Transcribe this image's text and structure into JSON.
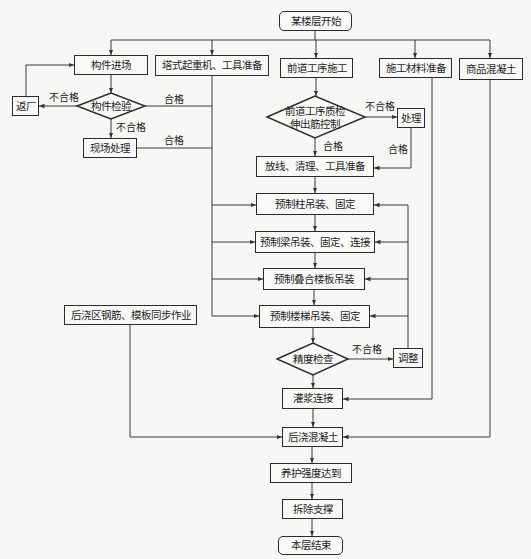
{
  "nodes": {
    "start": "某楼层开始",
    "component_arrival": "构件进场",
    "tower_crane_prep": "塔式起重机、工具准备",
    "prev_process": "前道工序施工",
    "material_prep": "施工材料准备",
    "ready_mix_concrete": "商品混凝土",
    "return_factory": "返厂",
    "component_inspection": "构件检验",
    "onsite_treatment": "现场处理",
    "prev_quality_check": {
      "line1": "前道工序质检",
      "line2": "伸出筋控制"
    },
    "treatment": "处理",
    "layout_clean_prep": "放线、清理、工具准备",
    "column_hoist": "预制柱吊装、固定",
    "beam_hoist": "预制梁吊装、固定、连接",
    "slab_hoist": "预制叠合楼板吊装",
    "stair_hoist": "预制楼梯吊装、固定",
    "precision_check": "精度检查",
    "adjust": "调整",
    "grouting": "灌浆连接",
    "post_pour_rebar_formwork": "后浇区钢筋、模板同步作业",
    "post_pour_concrete": "后浇混凝土",
    "curing": "养护强度达到",
    "remove_support": "拆除支撑",
    "end": "本层结束"
  },
  "edge_labels": {
    "inspection_fail_return": "不合格",
    "inspection_pass": "合格",
    "inspection_fail_onsite": "不合格",
    "onsite_pass": "合格",
    "quality_fail": "不合格",
    "quality_pass": "合格",
    "treatment_pass": "合格",
    "precision_fail": "不合格"
  },
  "colors": {
    "line": "#3a3a3a",
    "border": "#2b2b2b",
    "background": "#f7f7f5"
  }
}
